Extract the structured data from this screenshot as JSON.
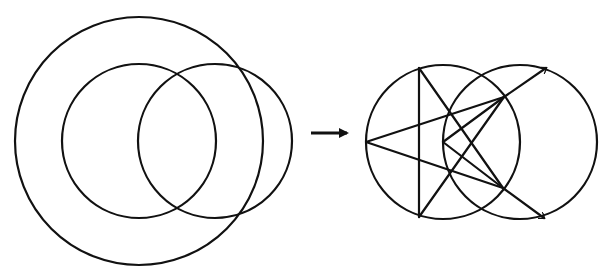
{
  "diagram": {
    "description": "Left: a large circle containing two overlapping equal circles. Arrow to the right. Right: two overlapping circles with a star-like pattern of chords and two arrow-tipped lines.",
    "stroke_color": "#111111",
    "background": "#ffffff",
    "left_figure": {
      "circles": [
        {
          "name": "outer",
          "cx": 139,
          "cy": 141,
          "r": 124
        },
        {
          "name": "inner-left",
          "cx": 139,
          "cy": 141,
          "r": 77
        },
        {
          "name": "inner-right",
          "cx": 215,
          "cy": 141,
          "r": 77
        }
      ]
    },
    "transition_arrow": {
      "x1": 311,
      "y1": 133,
      "x2": 347,
      "y2": 133
    },
    "right_figure": {
      "circles": [
        {
          "name": "left",
          "cx": 443,
          "cy": 142,
          "r": 77
        },
        {
          "name": "right",
          "cx": 520,
          "cy": 142,
          "r": 77
        }
      ],
      "points": {
        "A": [
          366,
          142
        ],
        "B": [
          419,
          68
        ],
        "C": [
          419,
          217
        ],
        "D": [
          504,
          97
        ],
        "E": [
          503,
          188
        ],
        "F": [
          443,
          142
        ],
        "T": [
          546,
          68
        ],
        "U": [
          544,
          218
        ]
      },
      "segments": [
        [
          "B",
          "C"
        ],
        [
          "A",
          "D"
        ],
        [
          "A",
          "E"
        ],
        [
          "B",
          "E"
        ],
        [
          "C",
          "D"
        ],
        [
          "F",
          "D"
        ],
        [
          "F",
          "E"
        ]
      ],
      "arrows": [
        [
          "D",
          "T"
        ],
        [
          "E",
          "U"
        ]
      ]
    }
  }
}
